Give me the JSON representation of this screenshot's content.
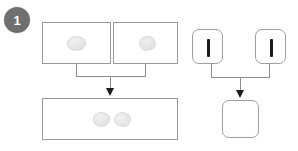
{
  "step": {
    "badge_number": "1",
    "badge_color": "#6f6f6f",
    "badge_text_color": "#ffffff"
  },
  "colors": {
    "panel_border": "#9a9a9a",
    "connector": "#8c8c8c",
    "arrow": "#1c1c1c",
    "blob_fill": "#e6e6e6",
    "bar_mark": "#1c1c1c",
    "background": "#ffffff"
  },
  "groups": [
    {
      "id": "left-group",
      "name": "blob-merge-group",
      "shape": "rectangle",
      "sources": [
        {
          "id": "left-source-panel-1",
          "label": "",
          "contents": [
            {
              "kind": "blob",
              "label": ""
            }
          ]
        },
        {
          "id": "left-source-panel-2",
          "label": "",
          "contents": [
            {
              "kind": "blob",
              "label": ""
            }
          ]
        }
      ],
      "target": {
        "id": "left-target-panel",
        "label": "",
        "contents": [
          {
            "kind": "blob",
            "label": ""
          },
          {
            "kind": "blob",
            "label": ""
          }
        ]
      }
    },
    {
      "id": "right-group",
      "name": "bar-merge-group",
      "shape": "rounded-square",
      "sources": [
        {
          "id": "right-source-panel-1",
          "label": "",
          "contents": [
            {
              "kind": "bar",
              "label": ""
            }
          ]
        },
        {
          "id": "right-source-panel-2",
          "label": "",
          "contents": [
            {
              "kind": "bar",
              "label": ""
            }
          ]
        }
      ],
      "target": {
        "id": "right-target-panel",
        "label": "",
        "contents": []
      }
    }
  ],
  "icons": {
    "arrow_down": "arrow-down-icon",
    "merge_bracket": "merge-bracket-icon"
  }
}
